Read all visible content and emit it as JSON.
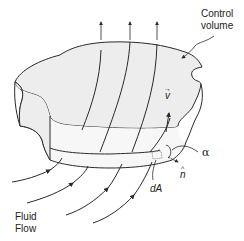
{
  "diagram": {
    "colors": {
      "stroke": "#2a2a2a",
      "fill": "#ededed",
      "background": "#ffffff"
    },
    "labels": {
      "control_volume_line1": "Control",
      "control_volume_line2": "volume",
      "velocity": "v",
      "velocity_arrow": "→",
      "alpha": "α",
      "normal": "n",
      "normal_hat": "^",
      "area_element": "dA",
      "fluid_flow_line1": "Fluid",
      "fluid_flow_line2": "Flow"
    },
    "elements": {
      "outflow_arrows": 3,
      "interior_streamlines": 4,
      "inflow_streamlines": 4
    }
  }
}
